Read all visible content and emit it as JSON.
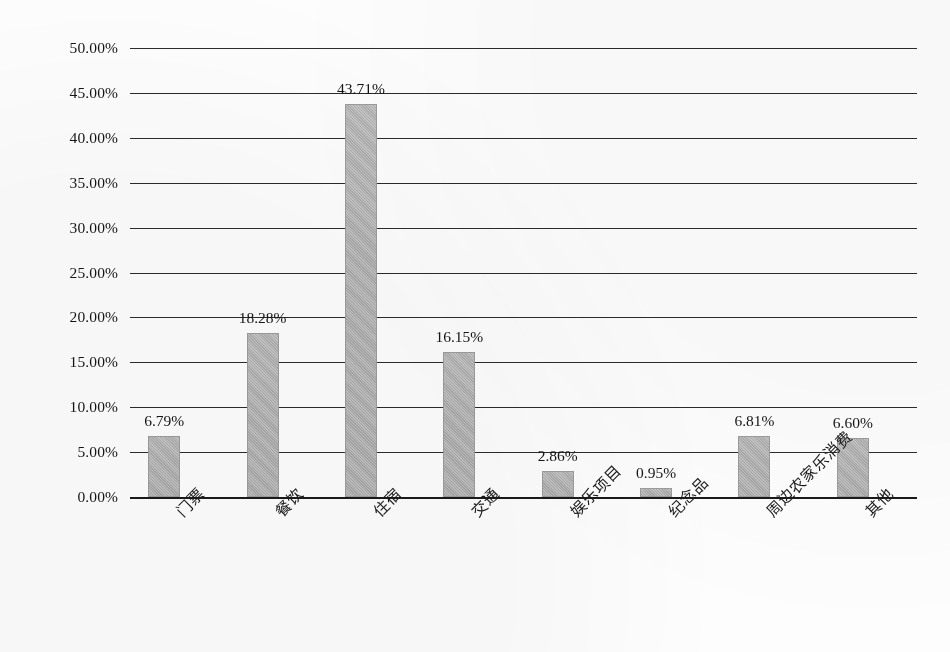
{
  "chart_data": {
    "type": "bar",
    "title": "",
    "subtitle": "",
    "xlabel": "",
    "ylabel": "",
    "ylim": [
      0,
      0.5
    ],
    "grid": true,
    "legend": "none",
    "categories": [
      "门票",
      "餐饮",
      "住宿",
      "交通",
      "娱乐项目",
      "纪念品",
      "周边农家乐消费",
      "其他"
    ],
    "values": [
      6.79,
      18.28,
      43.71,
      16.15,
      2.86,
      0.95,
      6.81,
      6.6
    ],
    "data_labels": [
      "6.79%",
      "18.28%",
      "43.71%",
      "16.15%",
      "2.86%",
      "0.95%",
      "6.81%",
      "6.60%"
    ],
    "ytick_labels": [
      "50.00%",
      "45.00%",
      "40.00%",
      "35.00%",
      "30.00%",
      "25.00%",
      "20.00%",
      "15.00%",
      "10.00%",
      "5.00%",
      "0.00%"
    ],
    "ytick_values": [
      50,
      45,
      40,
      35,
      30,
      25,
      20,
      15,
      10,
      5,
      0
    ],
    "bar_color": "#b0b0b0",
    "gridline_color": "#2b2b2b",
    "series": [
      {
        "name": "占比",
        "values": [
          6.79,
          18.28,
          43.71,
          16.15,
          2.86,
          0.95,
          6.81,
          6.6
        ]
      }
    ]
  }
}
